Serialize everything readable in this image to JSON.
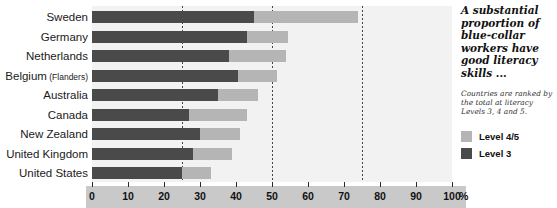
{
  "chart_data": {
    "type": "bar",
    "orientation": "horizontal",
    "stacked": true,
    "title": "A substantial proportion of blue-collar workers have good literacy skills ...",
    "subtitle": "Countries are ranked by the total at literacy Levels 3, 4 and 5.",
    "xlabel": "%",
    "ylabel": "",
    "xlim": [
      0,
      100
    ],
    "xticks": [
      0,
      10,
      20,
      30,
      40,
      50,
      60,
      70,
      80,
      90,
      100
    ],
    "xtick_labels": [
      "0",
      "10",
      "20",
      "30",
      "40",
      "50",
      "60",
      "70",
      "80",
      "90",
      "100"
    ],
    "gridlines_at": [
      25,
      50,
      75
    ],
    "grid": true,
    "legend_position": "right",
    "categories": [
      "Sweden",
      "Germany",
      "Netherlands",
      "Belgium (Flanders)",
      "Australia",
      "Canada",
      "New Zealand",
      "United Kingdom",
      "United States"
    ],
    "category_sublabels": [
      "",
      "",
      "",
      "(Flanders)",
      "",
      "",
      "",
      "",
      ""
    ],
    "category_mainlabels": [
      "Sweden",
      "Germany",
      "Netherlands",
      "Belgium",
      "Australia",
      "Canada",
      "New Zealand",
      "United Kingdom",
      "United States"
    ],
    "series": [
      {
        "name": "Level 3",
        "color": "#4a4a4a",
        "values": [
          45,
          43,
          38,
          40.5,
          35,
          27,
          30,
          28,
          25
        ]
      },
      {
        "name": "Level 4/5",
        "color": "#b5b5b5",
        "values": [
          29,
          11.5,
          16,
          11,
          11,
          16,
          11,
          11,
          8
        ]
      }
    ],
    "totals": [
      74,
      54.5,
      54,
      51.5,
      46,
      43,
      41,
      39,
      33
    ]
  },
  "annotation": {
    "headline": "A substantial proportion of blue-collar workers have good literacy skills ...",
    "note": "Countries are ranked by the total at literacy Levels 3, 4 and 5."
  },
  "legend": {
    "items": [
      {
        "label": "Level 4/5",
        "color": "#b5b5b5"
      },
      {
        "label": "Level 3",
        "color": "#4a4a4a"
      }
    ]
  },
  "axis": {
    "unit": "%"
  },
  "colors": {
    "level3": "#4a4a4a",
    "level45": "#b5b5b5",
    "plot_background": "#f2f2f2",
    "axis_strip": "#c9c9c9",
    "gridline": "#444444"
  }
}
